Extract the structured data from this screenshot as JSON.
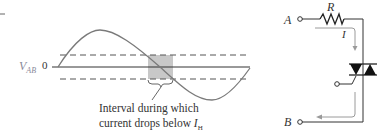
{
  "waveform": {
    "axis_label": "V",
    "axis_label_sub": "AB",
    "zero_label": "0",
    "annotation_line1": "Interval during which",
    "annotation_line2_prefix": "current drops below ",
    "annotation_symbol": "I",
    "annotation_symbol_sub": "H",
    "shaded_color": "#c8c8c8",
    "curve_color": "#7a7a7a"
  },
  "circuit": {
    "node_a": "A",
    "node_b": "B",
    "resistor_label": "R",
    "current_label": "I",
    "device": "triac",
    "arrow_color": "#9a9a9a"
  }
}
